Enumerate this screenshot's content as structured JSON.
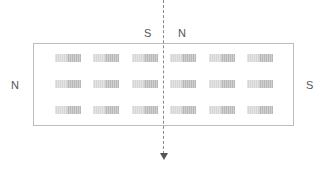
{
  "diagram": {
    "labels": {
      "top_left_pole": "S",
      "top_right_pole": "N",
      "left_pole": "N",
      "right_pole": "S"
    },
    "magnet_grid": {
      "rows": 3,
      "columns": 6
    },
    "colors": {
      "border": "#bdbdbd",
      "magnet_light": "#d6d6d6",
      "magnet_dark": "#b8b8b8",
      "dashed_line": "#8a8a8a",
      "text": "#555555"
    }
  }
}
